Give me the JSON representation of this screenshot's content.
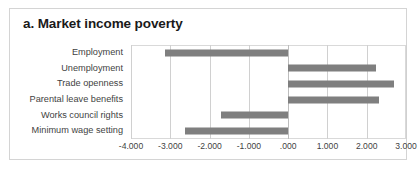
{
  "chart_data": {
    "type": "bar",
    "orientation": "horizontal",
    "title": "a. Market income poverty",
    "xlabel": "",
    "ylabel": "",
    "categories": [
      "Employment",
      "Unemployment",
      "Trade openness",
      "Parental leave benefits",
      "Works council rights",
      "Minimum wage setting"
    ],
    "values": [
      -3.13,
      2.23,
      2.69,
      2.31,
      -1.72,
      -2.62
    ],
    "xlim": [
      -4.0,
      3.0
    ],
    "xticks": [
      -4.0,
      -3.0,
      -2.0,
      -1.0,
      0.0,
      1.0,
      2.0,
      3.0
    ],
    "xtick_labels": [
      "-4.000",
      "-3.000",
      "-2.000",
      "-1.000",
      ".000",
      "1.000",
      "2.000",
      "3.000"
    ],
    "grid": true,
    "legend": false,
    "series": [
      {
        "name": "Market income poverty",
        "color": "#7f7f7f",
        "values": [
          -3.13,
          2.23,
          2.69,
          2.31,
          -1.72,
          -2.62
        ]
      }
    ]
  },
  "colors": {
    "bar": "#7f7f7f",
    "gridline": "#d0d0d0",
    "frame": "#d4d4d4",
    "title_text": "#1a1a1a",
    "label_text": "#3f3f3f"
  }
}
